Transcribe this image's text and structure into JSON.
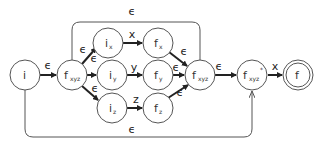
{
  "diagram": {
    "type": "nfa-state-diagram",
    "colors": {
      "stroke": "#555555",
      "edge": "#222222",
      "background": "#ffffff"
    },
    "nodes": [
      {
        "id": "i",
        "label": "i",
        "sub": "",
        "sup": "",
        "accepting": false
      },
      {
        "id": "fxyz1",
        "label": "f",
        "sub": "xyz",
        "sup": "",
        "accepting": false
      },
      {
        "id": "ix",
        "label": "i",
        "sub": "x",
        "sup": "",
        "accepting": false
      },
      {
        "id": "iy",
        "label": "i",
        "sub": "y",
        "sup": "",
        "accepting": false
      },
      {
        "id": "iz",
        "label": "i",
        "sub": "z",
        "sup": "",
        "accepting": false
      },
      {
        "id": "fx",
        "label": "f",
        "sub": "x",
        "sup": "",
        "accepting": false
      },
      {
        "id": "fy",
        "label": "f",
        "sub": "y",
        "sup": "",
        "accepting": false
      },
      {
        "id": "fz",
        "label": "f",
        "sub": "z",
        "sup": "",
        "accepting": false
      },
      {
        "id": "fxyz2",
        "label": "f",
        "sub": "xyz",
        "sup": "",
        "accepting": false
      },
      {
        "id": "fxyzstar",
        "label": "f",
        "sub": "xyz",
        "sup": "*",
        "accepting": false
      },
      {
        "id": "f",
        "label": "f",
        "sub": "",
        "sup": "",
        "accepting": true
      }
    ],
    "edges": [
      {
        "from": "i",
        "to": "fxyz1",
        "label": "ϵ"
      },
      {
        "from": "fxyz1",
        "to": "ix",
        "label": "ϵ"
      },
      {
        "from": "fxyz1",
        "to": "iy",
        "label": "ϵ"
      },
      {
        "from": "fxyz1",
        "to": "iz",
        "label": "ϵ"
      },
      {
        "from": "ix",
        "to": "fx",
        "label": "x"
      },
      {
        "from": "iy",
        "to": "fy",
        "label": "y"
      },
      {
        "from": "iz",
        "to": "fz",
        "label": "z"
      },
      {
        "from": "fx",
        "to": "fxyz2",
        "label": "ϵ"
      },
      {
        "from": "fy",
        "to": "fxyz2",
        "label": "ϵ"
      },
      {
        "from": "fz",
        "to": "fxyz2",
        "label": "ϵ"
      },
      {
        "from": "fxyz2",
        "to": "fxyz1",
        "label": "ϵ"
      },
      {
        "from": "fxyz2",
        "to": "fxyzstar",
        "label": "ϵ"
      },
      {
        "from": "i",
        "to": "fxyzstar",
        "label": "ϵ"
      },
      {
        "from": "fxyzstar",
        "to": "f",
        "label": "x"
      }
    ]
  }
}
